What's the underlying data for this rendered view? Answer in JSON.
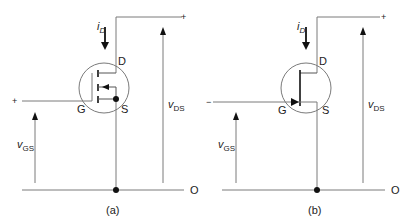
{
  "figure": {
    "panels": [
      {
        "id": "a",
        "caption": "(a)",
        "device": "enhancement MOSFET",
        "labels": {
          "drain": "D",
          "gate": "G",
          "source": "S",
          "current": "i",
          "current_sub": "D",
          "vgs": "v",
          "vgs_sub": "GS",
          "vds": "v",
          "vds_sub": "DS",
          "plus_gate": "+",
          "plus_drain": "+",
          "terminal": "O"
        }
      },
      {
        "id": "b",
        "caption": "(b)",
        "device": "JFET",
        "labels": {
          "drain": "D",
          "gate": "G",
          "source": "S",
          "current": "i",
          "current_sub": "D",
          "vgs": "v",
          "vgs_sub": "GS",
          "vds": "v",
          "vds_sub": "DS",
          "minus_gate": "−",
          "plus_drain": "+",
          "terminal": "O"
        }
      }
    ],
    "colors": {
      "line": "#7a7a7a",
      "dark": "#111111",
      "text": "#222222"
    }
  }
}
